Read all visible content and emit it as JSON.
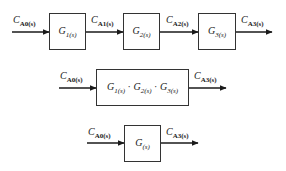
{
  "diagram": {
    "row1": {
      "blocks": [
        {
          "name": "G",
          "sub": "1(s)"
        },
        {
          "name": "G",
          "sub": "2(s)"
        },
        {
          "name": "G",
          "sub": "3(s)"
        }
      ],
      "signals": [
        {
          "name": "C",
          "sub": "A0(s)"
        },
        {
          "name": "C",
          "sub": "A1(s)"
        },
        {
          "name": "C",
          "sub": "A2(s)"
        },
        {
          "name": "C",
          "sub": "A3(s)"
        }
      ]
    },
    "row2": {
      "block": {
        "terms": [
          {
            "name": "G",
            "sub": "1(s)"
          },
          {
            "name": "G",
            "sub": "2(s)"
          },
          {
            "name": "G",
            "sub": "3(s)"
          }
        ],
        "operator": "·"
      },
      "input": {
        "name": "C",
        "sub": "A0(s)"
      },
      "output": {
        "name": "C",
        "sub": "A3(s)"
      }
    },
    "row3": {
      "block": {
        "name": "G",
        "sub": "(s)"
      },
      "input": {
        "name": "C",
        "sub": "A0(s)"
      },
      "output": {
        "name": "C",
        "sub": "A3(s)"
      }
    }
  }
}
